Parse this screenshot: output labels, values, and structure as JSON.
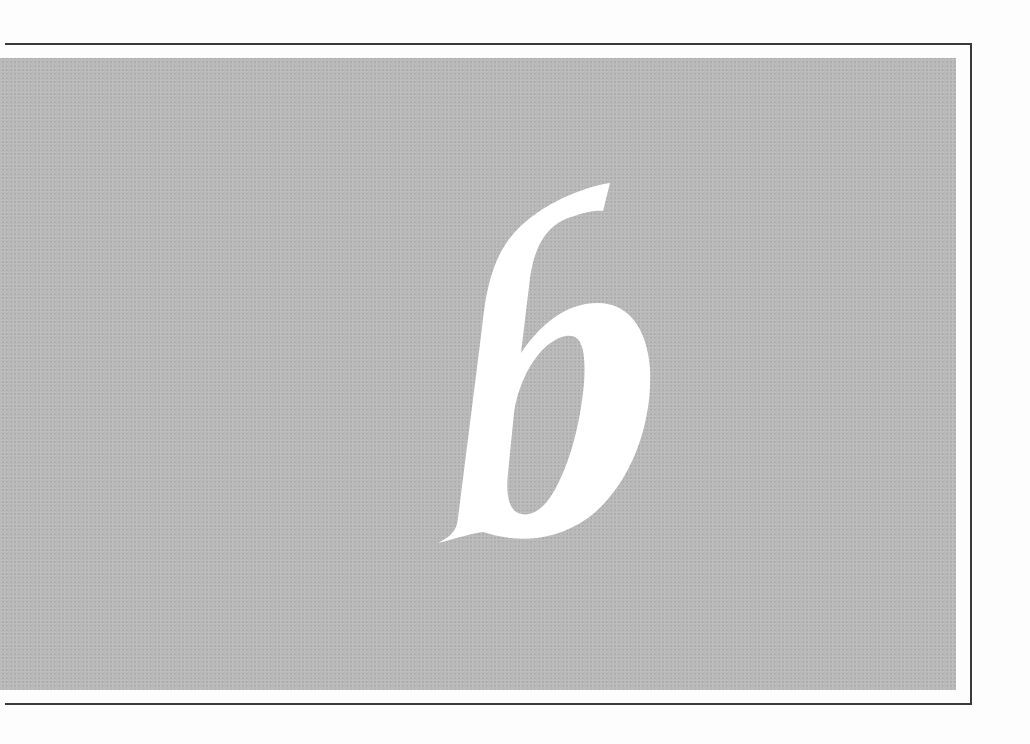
{
  "page": {
    "type": "chapter-opener",
    "chapter_number": "6",
    "colors": {
      "background": "#fdfdfd",
      "panel": "#b9b9b9",
      "frame": "#3a3a3a",
      "numeral": "#ffffff"
    }
  }
}
